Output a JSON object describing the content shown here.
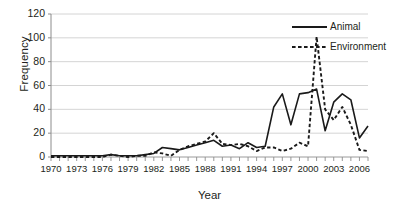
{
  "chart_data": {
    "type": "line",
    "title": "",
    "xlabel": "Year",
    "ylabel": "Frequency",
    "xlim": [
      1970,
      2007
    ],
    "ylim": [
      0,
      120
    ],
    "ytick_values": [
      0,
      20,
      40,
      60,
      80,
      100,
      120
    ],
    "ytick_labels": [
      "0",
      "20",
      "40",
      "60",
      "80",
      "100",
      "120"
    ],
    "xtick_labels": [
      "1970",
      "1973",
      "1976",
      "1979",
      "1982",
      "1985",
      "1988",
      "1991",
      "1994",
      "1997",
      "2000",
      "2003",
      "2006"
    ],
    "xtick_values": [
      1970,
      1973,
      1976,
      1979,
      1982,
      1985,
      1988,
      1991,
      1994,
      1997,
      2000,
      2003,
      2006
    ],
    "x": [
      1970,
      1971,
      1972,
      1973,
      1974,
      1975,
      1976,
      1977,
      1978,
      1979,
      1980,
      1981,
      1982,
      1983,
      1984,
      1985,
      1986,
      1987,
      1988,
      1989,
      1990,
      1991,
      1992,
      1993,
      1994,
      1995,
      1996,
      1997,
      1998,
      1999,
      2000,
      2001,
      2002,
      2003,
      2004,
      2005,
      2006,
      2007
    ],
    "grid": "horizontal",
    "legend_position": "top-right-inside",
    "series": [
      {
        "name": "Animal",
        "style": "solid",
        "color": "#1a1a1a",
        "values": [
          1,
          1,
          1,
          1,
          1,
          1,
          1,
          2,
          1,
          1,
          1,
          2,
          3,
          8,
          7,
          6,
          8,
          10,
          12,
          14,
          9,
          10,
          7,
          12,
          8,
          9,
          42,
          53,
          27,
          53,
          54,
          57,
          22,
          46,
          53,
          48,
          16,
          26
        ]
      },
      {
        "name": "Environment",
        "style": "dashed",
        "color": "#1a1a1a",
        "values": [
          0,
          0,
          0,
          0,
          0,
          0,
          0,
          2,
          1,
          0,
          1,
          1,
          4,
          3,
          1,
          6,
          9,
          11,
          13,
          20,
          11,
          10,
          11,
          9,
          5,
          8,
          8,
          5,
          7,
          12,
          9,
          101,
          40,
          31,
          42,
          27,
          6,
          5
        ]
      }
    ]
  },
  "axes": {
    "ylabel": "Frequency",
    "xlabel": "Year"
  },
  "legend": {
    "items": [
      {
        "label": "Animal",
        "style": "solid"
      },
      {
        "label": "Environment",
        "style": "dashed"
      }
    ]
  }
}
